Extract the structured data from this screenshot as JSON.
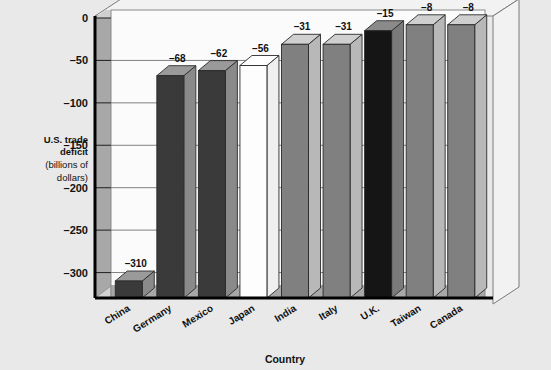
{
  "chart_data": {
    "type": "bar",
    "title": "",
    "subtitle": "",
    "xlabel": "Country",
    "ylabel_line1": "U.S. trade",
    "ylabel_line2": "deficit",
    "ylabel_line3": "(billions of",
    "ylabel_line4": "dollars)",
    "categories": [
      "China",
      "Germany",
      "Mexico",
      "Japan",
      "India",
      "Italy",
      "U.K.",
      "Taiwan",
      "Canada"
    ],
    "values": [
      -310,
      -68,
      -62,
      -56,
      -31,
      -31,
      -15,
      -8,
      -8
    ],
    "value_labels": [
      "–310",
      "–68",
      "–62",
      "–56",
      "–31",
      "–31",
      "–15",
      "–8",
      "–8"
    ],
    "ytick_values": [
      0,
      -50,
      -100,
      -150,
      -200,
      -250,
      -300
    ],
    "ytick_labels": [
      "0",
      "–50",
      "–100",
      "–150",
      "–200",
      "–250",
      "–300"
    ],
    "ylim": [
      0,
      -330
    ],
    "grid": true,
    "legend": "none",
    "axis_inverted": true,
    "three_d": true,
    "bar_colors": [
      "#3a3a3a",
      "#3a3a3a",
      "#3a3a3a",
      "#fdfdfd",
      "#808080",
      "#808080",
      "#151515",
      "#808080",
      "#808080"
    ],
    "bar_top_colors": [
      "#9a9a9a",
      "#9a9a9a",
      "#9a9a9a",
      "#ffffff",
      "#cfcfcf",
      "#cfcfcf",
      "#8a8a8a",
      "#cfcfcf",
      "#cfcfcf"
    ],
    "bar_side_colors": [
      "#8a8a8a",
      "#8a8a8a",
      "#8a8a8a",
      "#efefef",
      "#b8b8b8",
      "#b8b8b8",
      "#7a7a7a",
      "#b8b8b8",
      "#b8b8b8"
    ]
  },
  "colors": {
    "background": "#e9e9e9",
    "plot_area": "#fbfbfb",
    "wall": "#a8a8a8",
    "floor": "#a8a8a8",
    "gridline": "#808080",
    "axis": "#000000",
    "frame": "#6e6e6e"
  }
}
